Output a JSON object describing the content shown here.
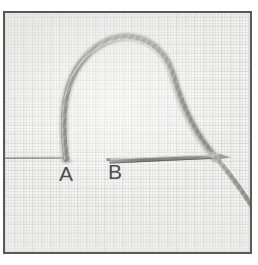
{
  "figure": {
    "kind": "stitch-photograph",
    "frame_border_color": "#595959",
    "fabric_color": "#f3f3f1",
    "thread_color": "#9a9a92",
    "needle_color": "#8c8c88",
    "label_color": "#4d4d4d"
  },
  "labels": [
    {
      "id": "a",
      "text": "A"
    },
    {
      "id": "b",
      "text": "B"
    }
  ],
  "elements": {
    "thread_loop_name": "thread-loop",
    "needle_name": "needle",
    "fabric_name": "fabric-surface",
    "entry_point_a": "A",
    "exit_point_b": "B"
  }
}
